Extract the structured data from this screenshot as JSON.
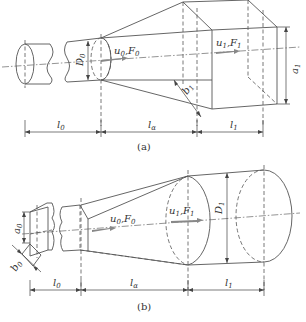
{
  "figure_a": {
    "caption": "(a)",
    "labels": {
      "D0": "D",
      "D0_sub": "0",
      "u0F0": "u",
      "u0F0_sub": "0",
      "u0F0_F": ",F",
      "u0F0_Fsub": "0",
      "u1F1": "u",
      "u1F1_sub": "1",
      "u1F1_F": ",F",
      "u1F1_Fsub": "1",
      "a1": "a",
      "a1_sub": "1",
      "b1": "b",
      "b1_sub": "1"
    },
    "dimensions": {
      "l0": "l",
      "l0_sub": "0",
      "la": "l",
      "la_sub": "α",
      "l1": "l",
      "l1_sub": "1"
    }
  },
  "figure_b": {
    "caption": "(b)",
    "labels": {
      "a0": "a",
      "a0_sub": "0",
      "b0": "b",
      "b0_sub": "0",
      "u0F0": "u",
      "u0F0_sub": "0",
      "u0F0_F": ",F",
      "u0F0_Fsub": "0",
      "u1F1": "u",
      "u1F1_sub": "1",
      "u1F1_F": ",F",
      "u1F1_Fsub": "1",
      "D1": "D",
      "D1_sub": "1"
    },
    "dimensions": {
      "l0": "l",
      "l0_sub": "0",
      "la": "l",
      "la_sub": "α",
      "l1": "l",
      "l1_sub": "1"
    }
  }
}
